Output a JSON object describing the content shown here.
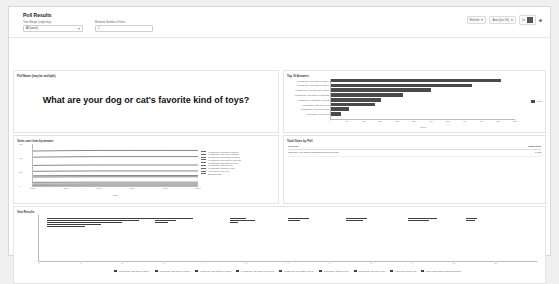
{
  "app": {
    "title": "Poll Results"
  },
  "filters": {
    "time_range": {
      "label": "Time Range (single day)",
      "value": "All (ranch)"
    },
    "min_votes": {
      "label": "Minimum Number of Votes",
      "value": "1"
    }
  },
  "toolbar": {
    "refresh_label": "Refresh",
    "range_label": "Auto (last 1h)",
    "zoom_label": "1x",
    "menu_label": "⋮"
  },
  "question_panel": {
    "title": "Poll Name (may be multiple)",
    "question": "What are your dog or cat's favorite kind of toys?"
  },
  "chart_data": [
    {
      "id": "top_answers",
      "type": "bar",
      "orientation": "horizontal",
      "title": "Top 10 Answers",
      "xlabel": "Votes",
      "ylabel": "",
      "legend": [
        "Votes"
      ],
      "legend_position": "right",
      "grid": false,
      "xlim": [
        0,
        550
      ],
      "xticks": [
        0,
        50,
        100,
        150,
        200,
        250,
        300,
        350,
        400,
        450,
        500,
        550
      ],
      "categories": [
        "Anything they can chew or destroy",
        "Anything they can fetch or retrieve",
        "Anything they can squeak or crinkle",
        "Anything they can cuddle or nap with",
        "Anything they can chase or bat at",
        "Anything they can tug or pull",
        "Anything they can hide or bury",
        "I don't have a dog or cat"
      ],
      "values": [
        508,
        420,
        300,
        215,
        150,
        132,
        55,
        30
      ]
    },
    {
      "id": "votes_over_time",
      "type": "line",
      "title": "Votes over time by answer",
      "xlabel": "Date",
      "ylabel": "Votes",
      "legend_position": "right",
      "grid": false,
      "ylim": [
        0,
        600
      ],
      "yticks": [
        0,
        200,
        400,
        600
      ],
      "xticks": [
        "12:00",
        "15:00",
        "18:00",
        "21:00",
        "00:00",
        "03:00"
      ],
      "series": [
        {
          "name": "Anything they can chew or destroy",
          "values": [
            500,
            505,
            508,
            508,
            508,
            508
          ]
        },
        {
          "name": "Anything they can fetch or retrieve",
          "values": [
            412,
            417,
            420,
            420,
            420,
            420
          ]
        },
        {
          "name": "Anything they can squeak or crinkle",
          "values": [
            294,
            298,
            300,
            300,
            300,
            300
          ]
        },
        {
          "name": "Anything they can cuddle or nap with",
          "values": [
            210,
            213,
            215,
            215,
            215,
            215
          ]
        },
        {
          "name": "Anything they can chase or bat at",
          "values": [
            146,
            149,
            150,
            150,
            150,
            150
          ]
        },
        {
          "name": "Anything they can tug or pull",
          "values": [
            128,
            130,
            132,
            132,
            132,
            132
          ]
        },
        {
          "name": "Anything they can hide or bury",
          "values": [
            52,
            54,
            55,
            55,
            55,
            55
          ]
        },
        {
          "name": "I don't have a dog or cat",
          "values": [
            28,
            29,
            30,
            30,
            30,
            30
          ]
        },
        {
          "name": "Something else",
          "values": [
            10,
            11,
            12,
            12,
            12,
            12
          ]
        }
      ]
    },
    {
      "id": "vote_results",
      "type": "bar",
      "orientation": "horizontal",
      "title": "Vote Results",
      "xlabel": "",
      "ylabel": "",
      "grid": false,
      "xlim": [
        0,
        12
      ],
      "xticks": [
        0,
        1,
        2,
        3,
        4,
        5,
        6,
        7,
        8,
        9,
        10,
        11
      ],
      "legend_position": "bottom",
      "legend": [
        "Anything they can chew or destroy",
        "Anything they can fetch or retrieve",
        "Anything they can squeak or crinkle",
        "Anything they can cuddle or nap with",
        "Anything they can chase or bat at",
        "Anything they can tug or pull",
        "Anything they can hide or bury",
        "I don't have a dog or cat",
        "Some other answer participants picked"
      ],
      "categories": [
        "10:45",
        "10:50",
        "10:55",
        "11:00",
        "11:05",
        "11:10",
        "11:15"
      ],
      "clusters": [
        {
          "x": 0.2,
          "values": [
            2.6,
            2.2,
            1.8,
            1.3,
            0.9
          ]
        },
        {
          "x": 2.8,
          "values": [
            0.9,
            0.5,
            0.3
          ]
        },
        {
          "x": 4.6,
          "values": [
            0.4,
            0.6,
            0.2
          ]
        },
        {
          "x": 6.0,
          "values": [
            0.5,
            0.3
          ]
        },
        {
          "x": 7.4,
          "values": [
            0.5,
            0.4
          ]
        },
        {
          "x": 8.9,
          "values": [
            0.7,
            0.5
          ]
        },
        {
          "x": 10.3,
          "values": [
            0.25,
            0.2
          ]
        }
      ]
    }
  ],
  "totals_panel": {
    "title": "Total Votes by Poll",
    "columns": [
      "Poll Text",
      "Total Votes"
    ],
    "rows": [
      {
        "poll_text": "What are your dog or cat's favorite kind of toys?",
        "total_votes": "1,612"
      }
    ]
  }
}
